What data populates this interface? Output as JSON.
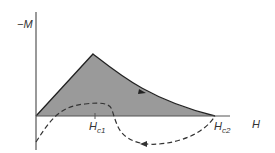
{
  "diagram": {
    "type": "magnetization-curve",
    "y_axis_label": "−M",
    "x_axis_label": "H",
    "markers": [
      {
        "label": "H",
        "subscript": "c1",
        "position": "lower critical field"
      },
      {
        "label": "H",
        "subscript": "c2",
        "position": "upper critical field"
      }
    ],
    "curves": [
      {
        "name": "reversible",
        "style": "solid",
        "fill": "shaded",
        "direction": "increasing H"
      },
      {
        "name": "irreversible",
        "style": "dashed",
        "direction": "decreasing H"
      }
    ],
    "colors": {
      "fill": "#9a9a9a",
      "line": "#222222",
      "axis": "#555555",
      "background": "#ffffff"
    }
  },
  "labels": {
    "neg_m": "−M",
    "h": "H",
    "hc1_main": "H",
    "hc1_sub": "c1",
    "hc2_main": "H",
    "hc2_sub": "c2"
  }
}
